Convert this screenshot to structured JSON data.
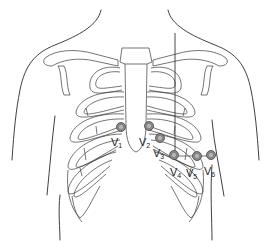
{
  "figure": {
    "colors": {
      "line": "#2a2a2a",
      "electrode_outer": "#8a8a8a",
      "electrode_inner": "#b5b5b5",
      "background": "#ffffff"
    },
    "electrodes": [
      {
        "id": "V1",
        "letter": "V",
        "sub": "1",
        "cx": 121,
        "cy": 127
      },
      {
        "id": "V2",
        "letter": "V",
        "sub": "2",
        "cx": 149,
        "cy": 126
      },
      {
        "id": "V3",
        "letter": "V",
        "sub": "3",
        "cx": 160,
        "cy": 138
      },
      {
        "id": "V4",
        "letter": "V",
        "sub": "4",
        "cx": 174,
        "cy": 155
      },
      {
        "id": "V5",
        "letter": "V",
        "sub": "5",
        "cx": 197,
        "cy": 156
      },
      {
        "id": "V6",
        "letter": "V",
        "sub": "6",
        "cx": 211,
        "cy": 155
      }
    ],
    "labels": {
      "v1": {
        "letter": "V",
        "sub": "1"
      },
      "v2": {
        "letter": "V",
        "sub": "2"
      },
      "v3": {
        "letter": "V",
        "sub": "3"
      },
      "v4": {
        "letter": "V",
        "sub": "4"
      },
      "v5": {
        "letter": "V",
        "sub": "5"
      },
      "v6": {
        "letter": "V",
        "sub": "6"
      }
    }
  }
}
